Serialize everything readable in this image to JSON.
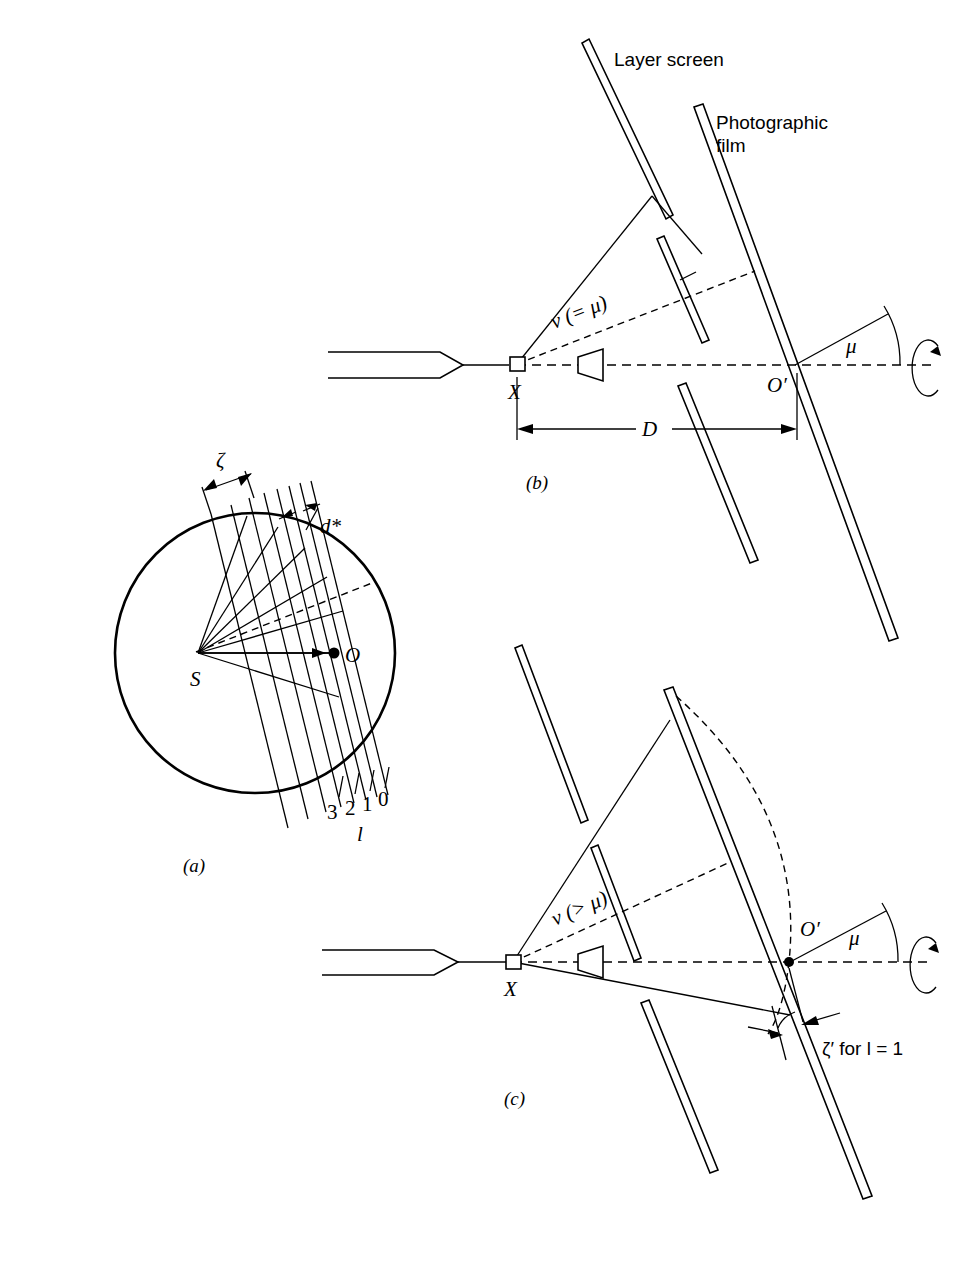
{
  "figure": {
    "type": "scientific-diagram",
    "background_color": "#ffffff",
    "ink_color": "#000000"
  },
  "panel_a": {
    "caption": "(a)",
    "labels": {
      "center": "S",
      "origin": "O",
      "zeta": "ζ",
      "dstar": "d*",
      "layer_index_axis": "l",
      "layer_numbers": [
        "3",
        "2",
        "1",
        "0"
      ]
    }
  },
  "panel_b": {
    "caption": "(b)",
    "labels": {
      "layer_screen": "Layer screen",
      "photographic_film": "Photographic\nfilm",
      "film_line1": "Photographic",
      "film_line2": "film",
      "crystal": "X",
      "film_origin": "O′",
      "cone_angle": "ν (= μ)",
      "mu": "μ",
      "distance": "D"
    }
  },
  "panel_c": {
    "caption": "(c)",
    "labels": {
      "crystal": "X",
      "film_origin": "O′",
      "cone_angle": "ν (> μ)",
      "mu": "μ",
      "zeta_prime": "ζ′ for l = 1"
    }
  }
}
